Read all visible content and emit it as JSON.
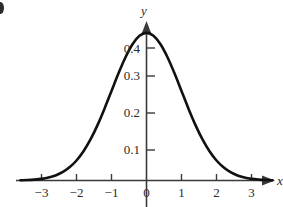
{
  "figure": {
    "background_color": "#ffffff",
    "curve_color": "#111111",
    "axis_color": "#3a3a3a",
    "corner_mark": "partial-bullet-mark"
  },
  "axes": {
    "x_name": "x",
    "y_name": "y",
    "x_arrow": "right-arrow-icon",
    "y_arrow": "up-arrow-icon"
  },
  "chart_data": {
    "type": "line",
    "title": "",
    "subtitle": "",
    "xlabel": "x",
    "ylabel": "y",
    "xlim": [
      -3.6,
      3.6
    ],
    "ylim": [
      0,
      0.44
    ],
    "xticks": [
      -3,
      -2,
      -1,
      0,
      1,
      2,
      3
    ],
    "xtick_labels": [
      "−3",
      "−2",
      "−1",
      "0",
      "1",
      "2",
      "3"
    ],
    "yticks": [
      0.1,
      0.2,
      0.3,
      0.4
    ],
    "ytick_labels": [
      "0.1",
      "0.2",
      "0.3",
      "0.4"
    ],
    "grid": false,
    "legend": false,
    "legend_position": "none",
    "annotations": [],
    "series": [
      {
        "name": "standard normal density",
        "x": [
          -3.6,
          -3.4,
          -3.2,
          -3.0,
          -2.8,
          -2.6,
          -2.4,
          -2.2,
          -2.0,
          -1.8,
          -1.6,
          -1.4,
          -1.2,
          -1.0,
          -0.8,
          -0.6,
          -0.4,
          -0.2,
          0.0,
          0.2,
          0.4,
          0.6,
          0.8,
          1.0,
          1.2,
          1.4,
          1.6,
          1.8,
          2.0,
          2.2,
          2.4,
          2.6,
          2.8,
          3.0,
          3.2,
          3.4,
          3.6
        ],
        "y": [
          0.0006,
          0.0012,
          0.0024,
          0.0044,
          0.0079,
          0.0136,
          0.0224,
          0.0355,
          0.054,
          0.079,
          0.1109,
          0.1497,
          0.1942,
          0.242,
          0.2897,
          0.3332,
          0.3683,
          0.391,
          0.3989,
          0.391,
          0.3683,
          0.3332,
          0.2897,
          0.242,
          0.1942,
          0.1497,
          0.1109,
          0.079,
          0.054,
          0.0355,
          0.0224,
          0.0136,
          0.0079,
          0.0044,
          0.0024,
          0.0012,
          0.0006
        ]
      }
    ],
    "peak": {
      "x": 0,
      "y": 0.3989
    }
  }
}
